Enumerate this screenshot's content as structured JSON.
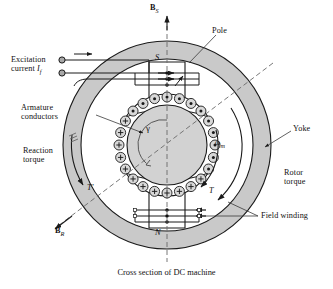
{
  "figure": {
    "caption": "Cross section of DC machine",
    "title": "Cross section of DC machine"
  },
  "axes": {
    "stator_field_label": "B",
    "stator_field_sub": "S",
    "rotor_field_label": "B",
    "rotor_field_sub": "R",
    "angle_label": "γ",
    "speed_label": "ω",
    "speed_sub": "m"
  },
  "poles": {
    "top_letter": "S",
    "bottom_letter": "N"
  },
  "torques": {
    "reaction_symbol": "T′",
    "rotor_symbol": "T"
  },
  "labels": {
    "excitation_line1": "Excitation",
    "excitation_line2": "current ",
    "excitation_current_symbol": "I",
    "excitation_current_sub": "f",
    "pole": "Pole",
    "armature_line1": "Armature",
    "armature_line2": "conductors",
    "reaction_line1": "Reaction",
    "reaction_line2": "torque",
    "yoke": "Yoke",
    "rotor_line1": "Rotor",
    "rotor_line2": "torque",
    "field_winding": "Field winding"
  },
  "colors": {
    "yoke_fill": "#c9c9c9",
    "pole_fill": "#ffffff",
    "rotor_fill": "#d2d2d2",
    "conductor_fill": "#d8d8d8",
    "stroke": "#1a1a1a",
    "dash": "#5a5a5a",
    "terminal_fill": "#a8a8a8"
  },
  "geometry": {
    "center_x": 167,
    "center_y": 145,
    "yoke_outer_radius": 104,
    "yoke_inner_radius": 86,
    "rotor_radius": 40,
    "conductor_ring_radius": 48,
    "conductor_count": 24,
    "axis_tilt_degrees": 35
  },
  "conductors": {
    "into_page_symbol": "+",
    "out_of_page_symbol": "·",
    "note_into": "crosses / plus marks on upper-left half",
    "note_out": "dots on lower-right half"
  }
}
